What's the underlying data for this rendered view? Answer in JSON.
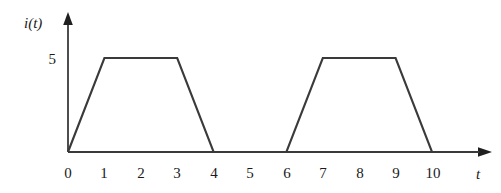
{
  "chart_data": {
    "type": "line",
    "title": "",
    "subtitle": "",
    "xlabel": "t",
    "ylabel": "i(t)",
    "xlim": [
      0,
      11.6
    ],
    "ylim": [
      0,
      6.6
    ],
    "grid": false,
    "legend": null,
    "x_ticks": [
      "0",
      "1",
      "2",
      "3",
      "4",
      "5",
      "6",
      "7",
      "8",
      "9",
      "10"
    ],
    "x_tick_values": [
      0,
      1,
      2,
      3,
      4,
      5,
      6,
      7,
      8,
      9,
      10
    ],
    "y_ticks": [
      "5"
    ],
    "y_tick_values": [
      5
    ],
    "series": [
      {
        "name": "i(t)",
        "color": "#3a3a3a",
        "x": [
          0,
          1,
          3,
          4,
          6,
          7,
          9,
          10,
          11.3
        ],
        "y": [
          0,
          5,
          5,
          0,
          0,
          5,
          5,
          0,
          0
        ]
      }
    ],
    "annotations": []
  },
  "axes": {
    "y_axis_label": "i(t)",
    "x_axis_label": "t",
    "y_tick_5": "5",
    "x_tick_0": "0",
    "x_tick_1": "1",
    "x_tick_2": "2",
    "x_tick_3": "3",
    "x_tick_4": "4",
    "x_tick_5": "5",
    "x_tick_6": "6",
    "x_tick_7": "7",
    "x_tick_8": "8",
    "x_tick_9": "9",
    "x_tick_10": "10"
  },
  "colors": {
    "background": "#ffffff",
    "axis": "#3a3a3a",
    "waveform": "#3a3a3a",
    "text": "#1a1a1a"
  }
}
